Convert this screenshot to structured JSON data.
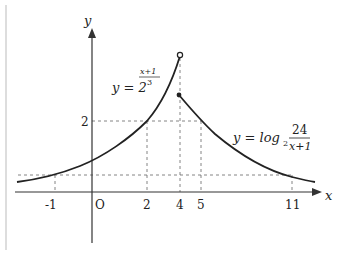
{
  "figure": {
    "axes": {
      "x_label": "x",
      "y_label": "y",
      "origin_label": "O"
    },
    "x_ticks": [
      "-1",
      "2",
      "4",
      "5",
      "11"
    ],
    "y_ticks": [
      "2"
    ],
    "curve1": {
      "label_prefix": "y = 2",
      "exponent_num": "x+1",
      "exponent_den": "3",
      "description": "y = 2^((x+1)/3), x < 4, open endpoint at x=4"
    },
    "curve2": {
      "label_prefix": "y = log",
      "base": "2",
      "frac_num": "24",
      "frac_den": "x+1",
      "description": "y = log2(24/(x+1)), x >= 4, closed endpoint at x=4"
    },
    "colors": {
      "curve": "#222222",
      "axis": "#333333",
      "guide": "#666666"
    }
  }
}
